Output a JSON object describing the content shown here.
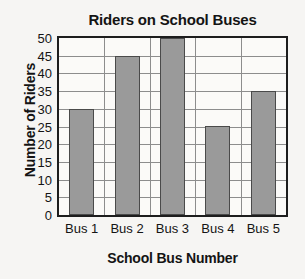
{
  "chart_data": {
    "type": "bar",
    "title": "Riders on School Buses",
    "xlabel": "School Bus Number",
    "ylabel": "Number of Riders",
    "categories": [
      "Bus 1",
      "Bus 2",
      "Bus 3",
      "Bus 4",
      "Bus 5"
    ],
    "values": [
      30,
      45,
      50,
      25,
      35
    ],
    "ylim": [
      0,
      50
    ],
    "ytick_labels": [
      "0",
      "5",
      "10",
      "15",
      "20",
      "25",
      "30",
      "35",
      "40",
      "45",
      "50"
    ],
    "ytick_values": [
      0,
      5,
      10,
      15,
      20,
      25,
      30,
      35,
      40,
      45,
      50
    ],
    "grid": "horizontal-and-vertical",
    "legend": "none",
    "colors": {
      "bar_fill": "#9a9a9a",
      "bar_edge": "#4a4a4a",
      "grid": "#8d8d8d",
      "frame": "#1d1d1d",
      "text": "#141414",
      "plot_background": "#fbfaf8",
      "page_background": "#f6f5f3"
    }
  }
}
